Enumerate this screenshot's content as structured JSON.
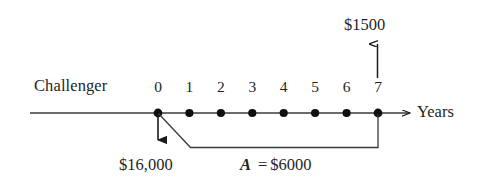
{
  "diagram": {
    "type": "cash-flow-timeline",
    "alternative_label": "Challenger",
    "axis_label": "Years",
    "axis_ticks": [
      "0",
      "1",
      "2",
      "3",
      "4",
      "5",
      "6",
      "7"
    ],
    "ink_color": "#1a1a1a",
    "background_color": "#ffffff",
    "cash_flows": {
      "salvage_value": {
        "label": "$1500",
        "direction": "up",
        "at_year": "7"
      },
      "initial_cost": {
        "label": "$16,000",
        "direction": "down",
        "at_year": "0"
      },
      "annual_cost": {
        "symbol": "A",
        "equals": "=",
        "amount": "$6000",
        "label": "A = $6000",
        "direction": "down",
        "from_year": "1",
        "to_year": "7"
      }
    }
  }
}
